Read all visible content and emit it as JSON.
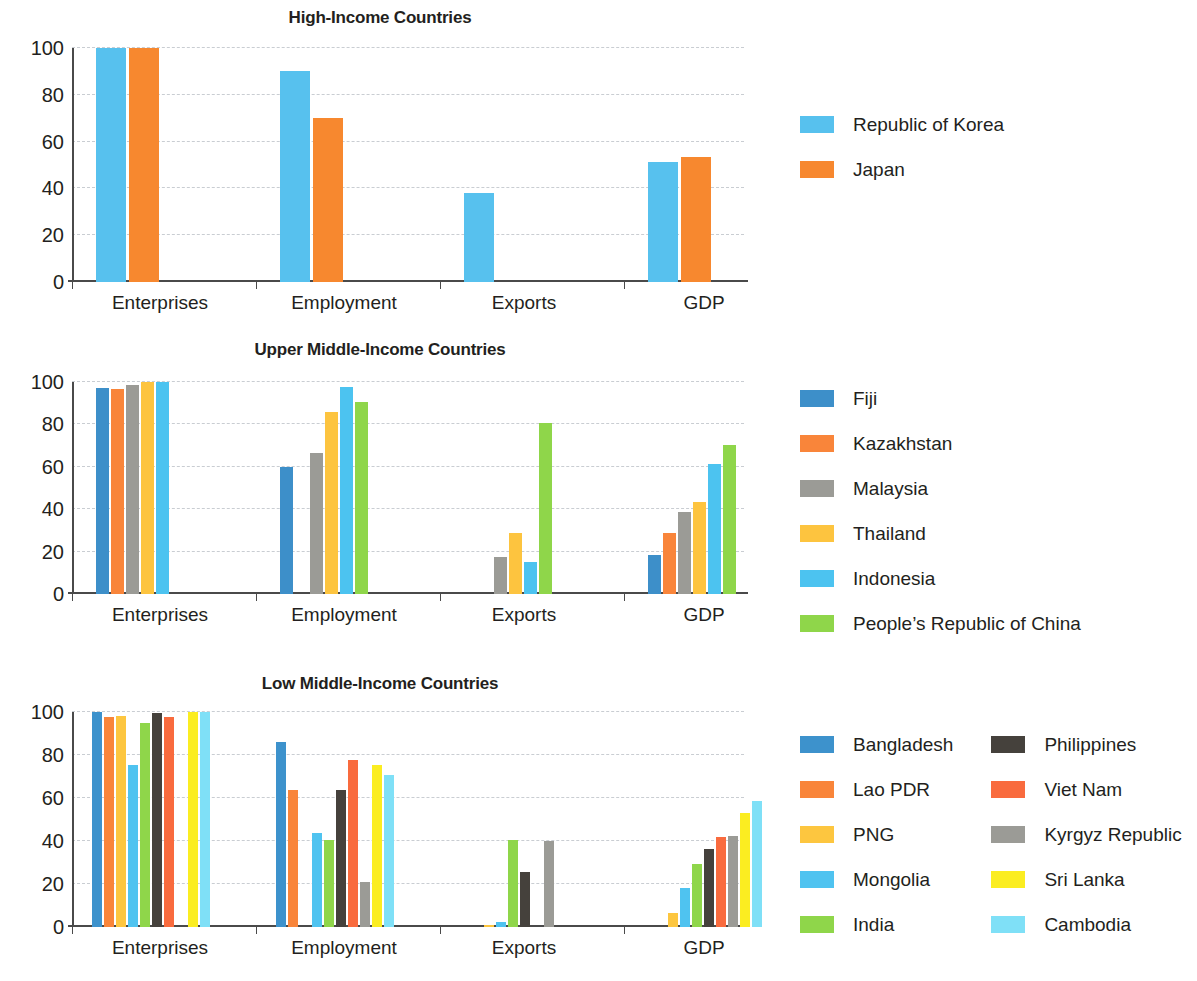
{
  "colors": {
    "korea_blue": "#57c1ee",
    "japan_orange": "#f7882f",
    "fiji_blue": "#3d8fc9",
    "kazakhstan_orange": "#f9853a",
    "malaysia_gray": "#9b9b96",
    "thailand_yellow": "#fdc43f",
    "indonesia_blue": "#4cc3f0",
    "prc_green": "#8fd64a",
    "bangladesh_blue": "#3d92cc",
    "lao_orange": "#f9853a",
    "png_yellow": "#fdc63f",
    "mongolia_blue": "#4fc3f0",
    "india_green": "#8fd64a",
    "philippines_dark": "#45413c",
    "vietnam_red": "#f96b3e",
    "kyrgyz_gray": "#9b9b96",
    "srilanka_yellow": "#fbed21",
    "cambodia_cyan": "#7fe0f7"
  },
  "axis": {
    "y_ticks": [
      "0",
      "20",
      "40",
      "60",
      "80",
      "100"
    ],
    "categories": [
      "Enterprises",
      "Employment",
      "Exports",
      "GDP"
    ]
  },
  "chart_data": [
    {
      "type": "bar",
      "title": "High-Income Countries",
      "xlabel": "",
      "ylabel": "",
      "ylim": [
        0,
        100
      ],
      "grid": true,
      "legend_position": "right",
      "categories": [
        "Enterprises",
        "Employment",
        "Exports",
        "GDP"
      ],
      "series": [
        {
          "name": "Republic of Korea",
          "color": "#57c1ee",
          "values": [
            100,
            90,
            38,
            51.5
          ]
        },
        {
          "name": "Japan",
          "color": "#f7882f",
          "values": [
            100,
            70,
            null,
            53.5
          ]
        }
      ]
    },
    {
      "type": "bar",
      "title": "Upper Middle-Income Countries",
      "xlabel": "",
      "ylabel": "",
      "ylim": [
        0,
        100
      ],
      "grid": true,
      "legend_position": "right",
      "categories": [
        "Enterprises",
        "Employment",
        "Exports",
        "GDP"
      ],
      "series": [
        {
          "name": "Fiji",
          "color": "#3d8fc9",
          "values": [
            97,
            60,
            null,
            18.5
          ]
        },
        {
          "name": "Kazakhstan",
          "color": "#f9853a",
          "values": [
            96.5,
            null,
            null,
            29
          ]
        },
        {
          "name": "Malaysia",
          "color": "#9b9b96",
          "values": [
            98.5,
            66.5,
            17.5,
            38.5
          ]
        },
        {
          "name": "Thailand",
          "color": "#fdc43f",
          "values": [
            100,
            86,
            29,
            43.5
          ]
        },
        {
          "name": "Indonesia",
          "color": "#4cc3f0",
          "values": [
            100,
            97.5,
            15,
            61.5
          ]
        },
        {
          "name": "People’s Republic of China",
          "color": "#8fd64a",
          "values": [
            null,
            90.5,
            80.5,
            70.5
          ]
        }
      ]
    },
    {
      "type": "bar",
      "title": "Low Middle-Income Countries",
      "xlabel": "",
      "ylabel": "",
      "ylim": [
        0,
        100
      ],
      "grid": true,
      "legend_position": "right",
      "categories": [
        "Enterprises",
        "Employment",
        "Exports",
        "GDP"
      ],
      "series": [
        {
          "name": "Bangladesh",
          "color": "#3d92cc",
          "values": [
            100,
            86,
            null,
            null
          ]
        },
        {
          "name": "Lao PDR",
          "color": "#f9853a",
          "values": [
            97.5,
            63.5,
            null,
            null
          ]
        },
        {
          "name": "PNG",
          "color": "#fdc63f",
          "values": [
            98,
            null,
            1,
            6.5
          ]
        },
        {
          "name": "Mongolia",
          "color": "#4fc3f0",
          "values": [
            75.5,
            43.5,
            2.5,
            18
          ]
        },
        {
          "name": "India",
          "color": "#8fd64a",
          "values": [
            95,
            40.5,
            40.5,
            29.5
          ]
        },
        {
          "name": "Philippines",
          "color": "#45413c",
          "values": [
            99.5,
            63.5,
            25.5,
            36.5
          ]
        },
        {
          "name": "Viet Nam",
          "color": "#f96b3e",
          "values": [
            97.5,
            77.5,
            null,
            42
          ]
        },
        {
          "name": "Kyrgyz Republic",
          "color": "#9b9b96",
          "values": [
            null,
            21,
            40,
            42.5
          ]
        },
        {
          "name": "Sri Lanka",
          "color": "#fbed21",
          "values": [
            100,
            75.5,
            null,
            53
          ]
        },
        {
          "name": "Cambodia",
          "color": "#7fe0f7",
          "values": [
            100,
            70.5,
            null,
            58.5
          ]
        }
      ]
    }
  ],
  "legends": [
    {
      "layout": "single",
      "items": [
        {
          "label": "Republic of Korea",
          "color": "#57c1ee"
        },
        {
          "label": "Japan",
          "color": "#f7882f"
        }
      ]
    },
    {
      "layout": "single",
      "items": [
        {
          "label": "Fiji",
          "color": "#3d8fc9"
        },
        {
          "label": "Kazakhstan",
          "color": "#f9853a"
        },
        {
          "label": "Malaysia",
          "color": "#9b9b96"
        },
        {
          "label": "Thailand",
          "color": "#fdc43f"
        },
        {
          "label": "Indonesia",
          "color": "#4cc3f0"
        },
        {
          "label": "People’s Republic of China",
          "color": "#8fd64a"
        }
      ]
    },
    {
      "layout": "two-column",
      "column_1": [
        {
          "label": "Bangladesh",
          "color": "#3d92cc"
        },
        {
          "label": "Lao PDR",
          "color": "#f9853a"
        },
        {
          "label": "PNG",
          "color": "#fdc63f"
        },
        {
          "label": "Mongolia",
          "color": "#4fc3f0"
        },
        {
          "label": "India",
          "color": "#8fd64a"
        }
      ],
      "column_2": [
        {
          "label": "Philippines",
          "color": "#45413c"
        },
        {
          "label": "Viet Nam",
          "color": "#f96b3e"
        },
        {
          "label": "Kyrgyz Republic",
          "color": "#9b9b96"
        },
        {
          "label": "Sri Lanka",
          "color": "#fbed21"
        },
        {
          "label": "Cambodia",
          "color": "#7fe0f7"
        }
      ]
    }
  ]
}
